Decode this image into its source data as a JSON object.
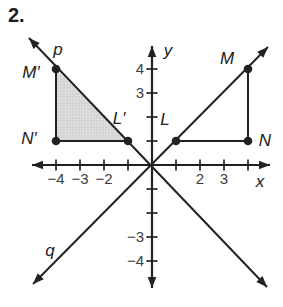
{
  "problem_number": "2.",
  "colors": {
    "background": "#ffffff",
    "ink": "#222222",
    "number_text": "#3d3d3d",
    "shade": "#dedede",
    "shade_dot": "#b9b9b9"
  },
  "figure": {
    "origin_px": [
      152,
      165
    ],
    "unit_px": 24,
    "axes": {
      "x_label": "x",
      "y_label": "y",
      "x_label_px": [
        260,
        187
      ],
      "y_label_px": [
        168,
        56
      ],
      "x_axis_px": [
        32,
        270
      ],
      "y_axis_px": [
        46,
        288
      ],
      "tick_values": [
        -4,
        -3,
        -2,
        -1,
        1,
        2,
        3,
        4
      ],
      "x_tick_labels": [
        {
          "value": -4,
          "text": "−4"
        },
        {
          "value": -3,
          "text": "−3"
        },
        {
          "value": -2,
          "text": "−2"
        },
        {
          "value": 2,
          "text": "2"
        },
        {
          "value": 3,
          "text": "3"
        }
      ],
      "y_tick_labels": [
        {
          "value": 4,
          "text": "4"
        },
        {
          "value": 3,
          "text": "3"
        },
        {
          "value": -3,
          "text": "−3"
        },
        {
          "value": -4,
          "text": "−4"
        }
      ]
    },
    "lines": [
      {
        "name": "line-p",
        "label": "p",
        "ends_px": [
          [
            29,
            38
          ],
          [
            267,
            287
          ]
        ],
        "label_px": [
          58,
          55
        ]
      },
      {
        "name": "line-q",
        "label": "q",
        "ends_px": [
          [
            33,
            284
          ],
          [
            268,
            47
          ]
        ],
        "label_px": [
          50,
          256
        ]
      }
    ],
    "points": [
      {
        "name": "M-prime",
        "label": "M′",
        "coords": [
          -4,
          4
        ],
        "label_px": [
          31,
          78
        ]
      },
      {
        "name": "N-prime",
        "label": "N′",
        "coords": [
          -4,
          1
        ],
        "label_px": [
          29,
          144
        ]
      },
      {
        "name": "L-prime",
        "label": "L′",
        "coords": [
          -1,
          1
        ],
        "label_px": [
          119,
          124
        ]
      },
      {
        "name": "L",
        "label": "L",
        "coords": [
          1,
          1
        ],
        "label_px": [
          165,
          125
        ]
      },
      {
        "name": "N",
        "label": "N",
        "coords": [
          4,
          1
        ],
        "label_px": [
          265,
          146
        ]
      },
      {
        "name": "M",
        "label": "M",
        "coords": [
          4,
          4
        ],
        "label_px": [
          227,
          64
        ]
      }
    ],
    "segments": [
      [
        "M-prime",
        "N-prime"
      ],
      [
        "N-prime",
        "L-prime"
      ],
      [
        "M",
        "N"
      ],
      [
        "L",
        "N"
      ]
    ],
    "shaded_triangle": [
      "M-prime",
      "N-prime",
      "L-prime"
    ]
  }
}
